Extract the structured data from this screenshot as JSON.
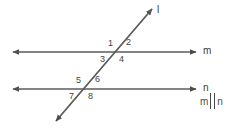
{
  "figure": {
    "background_color": "#ffffff",
    "stroke_color": "#5a5a5a",
    "text_color": "#3a3a3a"
  },
  "lines": {
    "m": {
      "label": "m"
    },
    "n": {
      "label": "n"
    },
    "transversal": {
      "label": "l"
    }
  },
  "angles": {
    "a1": "1",
    "a2": "2",
    "a3": "3",
    "a4": "4",
    "a5": "5",
    "a6": "6",
    "a7": "7",
    "a8": "8"
  },
  "relation": {
    "left": "m",
    "symbol": "||",
    "right": "n"
  }
}
